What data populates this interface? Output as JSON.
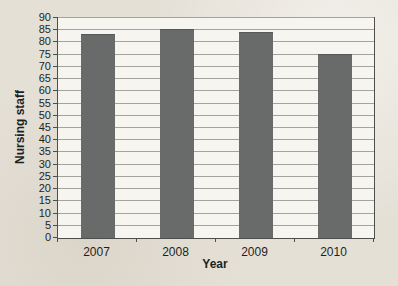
{
  "page": {
    "background_color": "#e5e0d6"
  },
  "chart_data": {
    "type": "bar",
    "categories": [
      "2007",
      "2008",
      "2009",
      "2010"
    ],
    "values": [
      83,
      85,
      84,
      75
    ],
    "title": "",
    "xlabel": "Year",
    "ylabel": "Nursing staff",
    "ylim": [
      0,
      90
    ],
    "ytick_step": 5,
    "grid": true,
    "legend": "none",
    "bar_color": "#696b6b",
    "plot_background": "#f7f5f0",
    "gridline_color": "#a3a29c",
    "axis_color": "#4e4e4c",
    "text_color": "#1f1f1f"
  }
}
